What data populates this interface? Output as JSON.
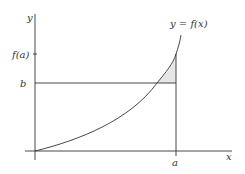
{
  "diagram": {
    "axes": {
      "x_label": "x",
      "y_label": "y"
    },
    "curve": {
      "label": "y = f(x)"
    },
    "y_ticks": [
      {
        "label": "f(a)"
      },
      {
        "label": "b"
      }
    ],
    "x_ticks": [
      {
        "label": "a"
      }
    ],
    "shaded_region": {
      "description": "area between curve and line y=b, from intersection to x=a",
      "fill": "#e6e6e6"
    },
    "colors": {
      "line": "#333333",
      "shade": "#e6e6e6",
      "background": "#ffffff"
    }
  }
}
